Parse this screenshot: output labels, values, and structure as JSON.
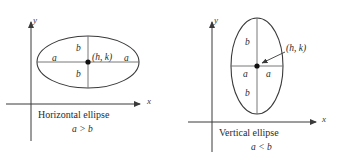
{
  "figure": {
    "background_color": "#ffffff",
    "stroke_color": "#3a3a3a",
    "text_color": "#2b2b2b"
  },
  "diagrams": [
    {
      "id": "horizontal-ellipse",
      "caption": "Horizontal ellipse",
      "relation": "a > b",
      "axis_x_label": "x",
      "axis_y_label": "y",
      "center_label": "(h, k)",
      "semi_major_label": "a",
      "semi_minor_label": "b",
      "labels": {
        "a_left": "a",
        "a_right": "a",
        "b_top": "b",
        "b_bottom": "b"
      }
    },
    {
      "id": "vertical-ellipse",
      "caption": "Vertical ellipse",
      "relation": "a < b",
      "axis_x_label": "x",
      "axis_y_label": "y",
      "center_label": "(h, k)",
      "semi_major_label": "b",
      "semi_minor_label": "a",
      "labels": {
        "a_left": "a",
        "a_right": "a",
        "b_top": "b",
        "b_bottom": "b"
      }
    }
  ]
}
